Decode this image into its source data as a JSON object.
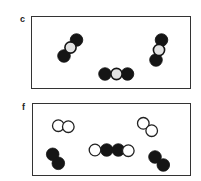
{
  "figure": {
    "panels": [
      {
        "label": "c",
        "frame": {
          "x": 31,
          "y": 16,
          "w": 160,
          "h": 73
        },
        "label_pos": {
          "x": 20,
          "y": 15
        },
        "molecules": [
          {
            "name": "diagonal-triatomic",
            "atoms": [
              {
                "x": 76.5,
                "y": 40,
                "type": "black"
              },
              {
                "x": 70.5,
                "y": 47.5,
                "type": "white"
              },
              {
                "x": 64,
                "y": 56,
                "type": "black"
              }
            ]
          },
          {
            "name": "horizontal-triatomic",
            "atoms": [
              {
                "x": 105,
                "y": 74,
                "type": "black"
              },
              {
                "x": 116.5,
                "y": 74,
                "type": "white"
              },
              {
                "x": 127.5,
                "y": 74,
                "type": "black"
              }
            ]
          },
          {
            "name": "vertical-triatomic",
            "atoms": [
              {
                "x": 161.5,
                "y": 40,
                "type": "black"
              },
              {
                "x": 159,
                "y": 50,
                "type": "white"
              },
              {
                "x": 156,
                "y": 60,
                "type": "black"
              }
            ]
          }
        ]
      },
      {
        "label": "f",
        "frame": {
          "x": 32,
          "y": 103,
          "w": 159,
          "h": 73
        },
        "label_pos": {
          "x": 22,
          "y": 103
        },
        "molecules": [
          {
            "name": "white-diatomic-left",
            "atoms": [
              {
                "x": 58.3,
                "y": 125.7,
                "type": "open"
              },
              {
                "x": 68.3,
                "y": 126.7,
                "type": "open"
              }
            ]
          },
          {
            "name": "black-diatomic-left",
            "atoms": [
              {
                "x": 52.7,
                "y": 154.3,
                "type": "black"
              },
              {
                "x": 58.3,
                "y": 163.3,
                "type": "black"
              }
            ]
          },
          {
            "name": "tetratomic-chain",
            "atoms": [
              {
                "x": 95,
                "y": 150,
                "type": "open"
              },
              {
                "x": 106.7,
                "y": 150,
                "type": "black"
              },
              {
                "x": 118.3,
                "y": 150,
                "type": "black"
              },
              {
                "x": 128.3,
                "y": 150.7,
                "type": "open"
              }
            ]
          },
          {
            "name": "white-diatomic-right",
            "atoms": [
              {
                "x": 143.3,
                "y": 123.3,
                "type": "open"
              },
              {
                "x": 151.7,
                "y": 130.7,
                "type": "open"
              }
            ]
          },
          {
            "name": "black-diatomic-right",
            "atoms": [
              {
                "x": 155,
                "y": 157,
                "type": "black"
              },
              {
                "x": 163.3,
                "y": 165,
                "type": "black"
              }
            ]
          }
        ]
      }
    ],
    "colors": {
      "black_atom": "#151515",
      "white_atom_fill": "#e2e2e2",
      "open_atom_fill": "#ffffff",
      "outline": "#222222",
      "frame": "#333333"
    },
    "atom_radius": 6.3
  }
}
